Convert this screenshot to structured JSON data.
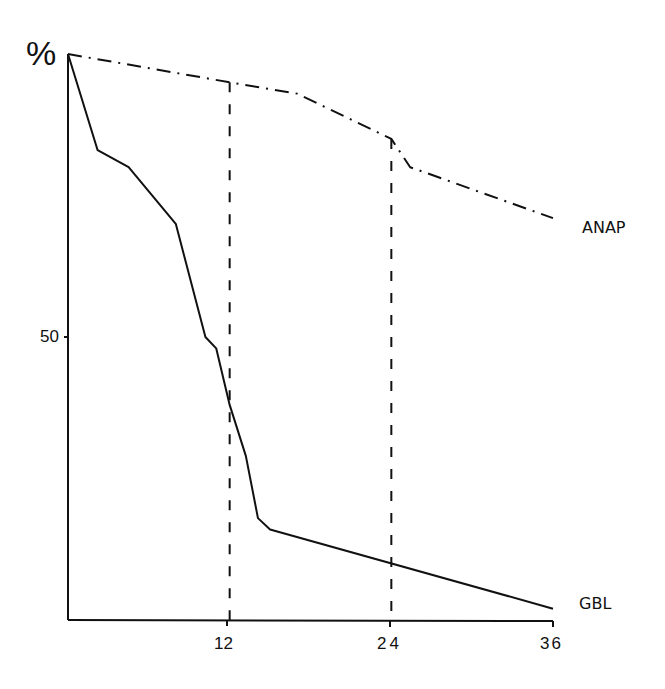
{
  "chart_data": {
    "type": "line",
    "title": "",
    "xlabel": "",
    "ylabel": "%",
    "xlim": [
      0,
      36
    ],
    "ylim": [
      0,
      100
    ],
    "x_ticks": [
      "12",
      "24",
      "36"
    ],
    "y_ticks": [
      "50"
    ],
    "grid": false,
    "legend_position": "inline-right",
    "series": [
      {
        "name": "ANAP",
        "style": "dash-dot",
        "points": [
          [
            0,
            100
          ],
          [
            12,
            95
          ],
          [
            17,
            93
          ],
          [
            24,
            85
          ],
          [
            25.4,
            80
          ],
          [
            36,
            71
          ]
        ]
      },
      {
        "name": "GBL",
        "style": "solid",
        "points": [
          [
            0,
            100
          ],
          [
            2.2,
            83
          ],
          [
            4.5,
            80
          ],
          [
            8,
            70
          ],
          [
            10.2,
            50
          ],
          [
            11,
            48
          ],
          [
            12,
            38
          ],
          [
            13.2,
            29
          ],
          [
            14.1,
            18
          ],
          [
            15,
            16
          ],
          [
            36,
            2
          ]
        ]
      }
    ],
    "annotations": [
      {
        "type": "vertical-dashed",
        "x": 12,
        "to_series": "ANAP"
      },
      {
        "type": "vertical-dashed",
        "x": 24,
        "to_series": "ANAP"
      }
    ]
  },
  "labels": {
    "y_unit": "%",
    "y_tick_50": "50",
    "x_tick_12": "12",
    "x_tick_24": "24",
    "x_tick_36": "36",
    "series_anap": "ANAP",
    "series_gbl": "GBL"
  }
}
